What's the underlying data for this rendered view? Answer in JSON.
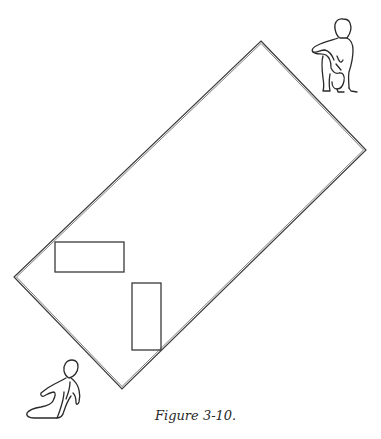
{
  "figure": {
    "caption": "Figure 3-10.",
    "colors": {
      "line": "#3a3a3a",
      "background": "#ffffff"
    }
  },
  "diagram": {
    "outer_rectangle": {
      "corners": {
        "top": [
          261,
          41
        ],
        "right": [
          366,
          150
        ],
        "bottom": [
          122,
          389
        ],
        "left": [
          14,
          277
        ]
      }
    },
    "inner_rectangles": [
      {
        "name": "horizontal-block",
        "x": 55,
        "y": 242,
        "width": 69,
        "height": 30
      },
      {
        "name": "vertical-block",
        "x": 132,
        "y": 283,
        "width": 29,
        "height": 67
      }
    ],
    "figures": [
      {
        "name": "crouching-figure",
        "position": "top-right",
        "x": 311,
        "y": 17,
        "width": 48,
        "height": 77
      },
      {
        "name": "seated-figure",
        "position": "bottom-left",
        "x": 26,
        "y": 358,
        "width": 56,
        "height": 62
      }
    ]
  }
}
